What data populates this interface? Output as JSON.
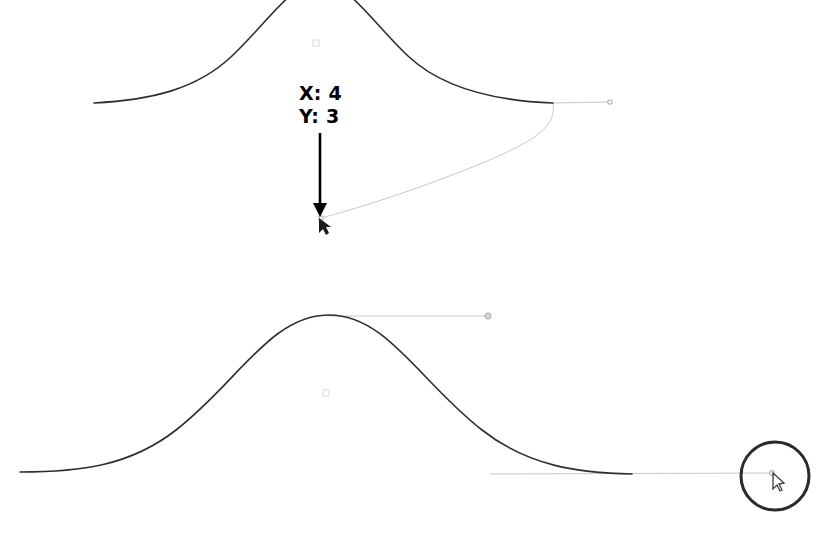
{
  "app": {
    "kind": "curve-editor-canvas",
    "background_color": "#ffffff"
  },
  "annotation": {
    "name": "coordinate-readout",
    "x_label": "X: 4",
    "y_label": "Y: 3",
    "text_color": "#000000",
    "arrow": {
      "name": "pointer-arrow",
      "color": "#000000",
      "from_x": 320,
      "from_y": 133,
      "to_x": 320,
      "to_y": 205
    }
  },
  "cursors": [
    {
      "name": "drag-cursor",
      "x": 319,
      "y": 218,
      "color": "#1a1a1a"
    },
    {
      "name": "handle-cursor",
      "x": 773,
      "y": 473,
      "color": "#3a3a3a"
    }
  ],
  "highlight": {
    "name": "cursor-highlight-circle",
    "cx": 775,
    "cy": 476,
    "r": 34,
    "stroke_color": "#2b2b2b",
    "stroke_width": 3
  },
  "colors": {
    "curve_stroke": "#2e2e2e",
    "handle_stroke": "#c9c9c9",
    "handle_point": "#b5b5b5",
    "faint_marker": "#e8e8e8"
  },
  "chart_data": {
    "type": "line",
    "title": "",
    "xlabel": "",
    "ylabel": "",
    "grid": false,
    "legend": null,
    "xlim": [
      0,
      828
    ],
    "ylim": [
      0,
      534
    ],
    "series": [
      {
        "name": "top-curve",
        "description": "bell-shaped curve clipped at top of canvas, being edited",
        "stroke": "#2e2e2e",
        "path": "M 94 103 C 150 100 196 90 232 56 C 268 22 292 -18 320 -18 C 348 -18 372 22 408 56 C 444 90 500 101 553 103",
        "points": [
          {
            "x": 94,
            "y": 103
          },
          {
            "x": 232,
            "y": 56
          },
          {
            "x": 320,
            "y": -18
          },
          {
            "x": 408,
            "y": 56
          },
          {
            "x": 553,
            "y": 103
          }
        ]
      },
      {
        "name": "bottom-curve",
        "description": "bell-shaped curve, smooth, lower half of canvas",
        "stroke": "#2e2e2e",
        "path": "M 20 472 C 80 472 130 466 176 430 C 238 382 270 316 328 315 C 386 314 420 382 482 430 C 528 466 578 473 632 474",
        "points": [
          {
            "x": 20,
            "y": 472
          },
          {
            "x": 176,
            "y": 430
          },
          {
            "x": 328,
            "y": 315
          },
          {
            "x": 482,
            "y": 430
          },
          {
            "x": 632,
            "y": 474
          }
        ]
      }
    ],
    "handles": [
      {
        "name": "top-right-handle-line",
        "stroke": "#c9c9c9",
        "x1": 553,
        "y1": 103,
        "x2": 610,
        "y2": 102,
        "endpoint": {
          "x": 610,
          "y": 102,
          "r": 2.2
        }
      },
      {
        "name": "dragged-handle-curve",
        "stroke": "#c9c9c9",
        "path": "M 553 103 C 556 126 540 140 470 168 C 410 192 352 210 321 218",
        "endpoint": {
          "x": 321,
          "y": 218,
          "r": 2.2
        }
      },
      {
        "name": "bottom-peak-handle-line",
        "stroke": "#c9c9c9",
        "x1": 328,
        "y1": 316,
        "x2": 488,
        "y2": 316,
        "endpoint": {
          "x": 488,
          "y": 316,
          "r": 2.8
        }
      },
      {
        "name": "bottom-right-handle-line",
        "stroke": "#c9c9c9",
        "x1": 490,
        "y1": 474,
        "x2": 772,
        "y2": 473,
        "endpoint": {
          "x": 772,
          "y": 473,
          "r": 2.4
        }
      }
    ],
    "markers": [
      {
        "name": "faint-marker-top",
        "x": 316,
        "y": 43,
        "size": 6,
        "color": "#e8e8e8"
      },
      {
        "name": "faint-marker-bottom",
        "x": 326,
        "y": 393,
        "size": 6,
        "color": "#e8e8e8"
      }
    ]
  }
}
